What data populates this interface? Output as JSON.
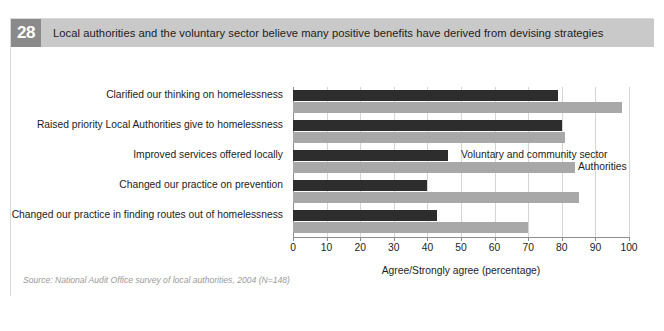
{
  "figure": {
    "number": "28",
    "title": "Local authorities and the voluntary sector believe many positive benefits have derived from devising strategies",
    "source": "Source: National Audit Office survey of local authorities, 2004 (N=148)"
  },
  "colors": {
    "header_band": "#c9c9c9",
    "number_badge": "#8a8a8a",
    "series_dark": "#2d2d2d",
    "series_light": "#a8a8a8",
    "gridline": "#d5d5d5",
    "axis": "#8d8d8d",
    "frame": "#d8d8d8",
    "source_text": "#9a9a9a"
  },
  "chart_data": {
    "type": "bar",
    "orientation": "horizontal",
    "title": "Local authorities and the voluntary sector believe many positive benefits have derived from devising strategies",
    "xlabel": "Agree/Strongly agree (percentage)",
    "ylabel": "",
    "xlim": [
      0,
      100
    ],
    "xticks": [
      0,
      10,
      20,
      30,
      40,
      50,
      60,
      70,
      80,
      90,
      100
    ],
    "xtick_labels": [
      "0",
      "10",
      "20",
      "30",
      "40",
      "50",
      "60",
      "70",
      "80",
      "90",
      "100"
    ],
    "grid": "vertical",
    "legend_position": "inline-annotation",
    "categories": [
      "Clarified our thinking on homelessness",
      "Raised priority Local Authorities give to homelessness",
      "Improved services offered locally",
      "Changed our practice on prevention",
      "Changed our practice in finding routes out of homelessness"
    ],
    "series": [
      {
        "name": "Voluntary and community sector",
        "color": "#2d2d2d",
        "values": [
          79,
          80,
          46,
          40,
          43
        ]
      },
      {
        "name": "Authorities",
        "color": "#a8a8a8",
        "values": [
          98,
          81,
          84,
          85,
          70
        ]
      }
    ],
    "annotations": [
      "Voluntary and community sector",
      "Authorities"
    ]
  }
}
